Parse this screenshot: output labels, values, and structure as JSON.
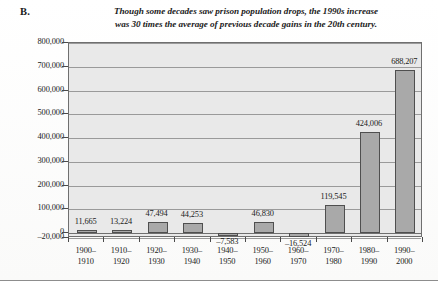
{
  "panel": {
    "letter": "B."
  },
  "chart_data": {
    "type": "bar",
    "title": "Though some decades saw prison population drops, the 1990s increase was 30 times the average of previous decade gains in the 20th century.",
    "title_lines": [
      "Though some decades saw prison population drops, the 1990s increase",
      "was 30 times the average of previous decade gains in the 20th century."
    ],
    "xlabel": "",
    "ylabel": "",
    "categories": [
      "1900-1910",
      "1910-1920",
      "1920-1930",
      "1930-1940",
      "1940-1950",
      "1950-1960",
      "1960-1970",
      "1970-1980",
      "1980-1990",
      "1990-2000"
    ],
    "category_lines": [
      [
        "1900–",
        "1910"
      ],
      [
        "1910–",
        "1920"
      ],
      [
        "1920–",
        "1930"
      ],
      [
        "1930–",
        "1940"
      ],
      [
        "1940–",
        "1950"
      ],
      [
        "1950–",
        "1960"
      ],
      [
        "1960–",
        "1970"
      ],
      [
        "1970–",
        "1980"
      ],
      [
        "1980–",
        "1990"
      ],
      [
        "1990–",
        "2000"
      ]
    ],
    "values": [
      11665,
      13224,
      47494,
      44253,
      -7583,
      46830,
      -16524,
      119545,
      424006,
      688207
    ],
    "value_labels": [
      "11,665",
      "13,224",
      "47,494",
      "44,253",
      "–7,583",
      "46,830",
      "–16,524",
      "119,545",
      "424,006",
      "688,207"
    ],
    "ylim": [
      -20000,
      800000
    ],
    "ytick_values": [
      800000,
      700000,
      600000,
      500000,
      400000,
      300000,
      200000,
      100000,
      0,
      -20000
    ],
    "ytick_labels": [
      "800,000",
      "700,000",
      "600,000",
      "500,000",
      "400,000",
      "300,000",
      "200,000",
      "100,000",
      "0",
      "–20,000"
    ],
    "grid": true,
    "legend": "none",
    "bar_color": "#a9a9a9",
    "bar_edge_color": "#4f4f4f",
    "plot_background": "#e9e9e9",
    "gridline_color": "#9a9a9a"
  }
}
